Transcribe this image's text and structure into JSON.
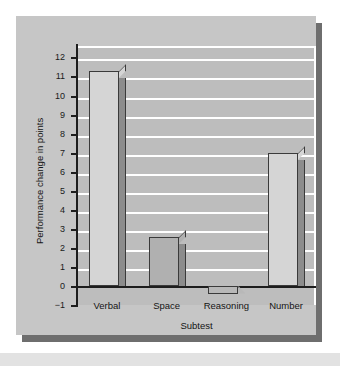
{
  "chart_data": {
    "type": "bar",
    "title": "",
    "xlabel": "Subtest",
    "ylabel": "Performance change in points",
    "categories": [
      "Verbal",
      "Space",
      "Reasoning",
      "Number"
    ],
    "values": [
      11.3,
      2.55,
      -0.4,
      7.0
    ],
    "series": [
      {
        "name": "Performance change",
        "values": [
          11.3,
          2.55,
          -0.4,
          7.0
        ]
      }
    ],
    "ylim": [
      -1,
      12.6
    ],
    "yticks": [
      -1,
      0,
      1,
      2,
      3,
      4,
      5,
      6,
      7,
      8,
      9,
      10,
      11,
      12
    ],
    "ytick_labels": [
      "−1",
      "0",
      "1",
      "2",
      "3",
      "4",
      "5",
      "6",
      "7",
      "8",
      "9",
      "10",
      "11",
      "12"
    ],
    "grid": true,
    "gridlines_at": [
      1,
      2,
      3,
      4,
      5,
      6,
      7,
      8,
      9,
      10,
      11,
      12
    ],
    "legend": null,
    "legend_position": "none",
    "bar_colors": [
      "#d5d5d5",
      "#b0b0b0",
      "#b8b8b8",
      "#d5d5d5"
    ],
    "bar_side_color": "#8c8c8c",
    "bar_edge_color": "#3a3a3a",
    "plot_background": "#bdbdbd",
    "panel_background": "#c6c6c6",
    "gridline_color": "#ffffff",
    "axis_color": "#1d1d1d",
    "text_color": "#141414"
  }
}
